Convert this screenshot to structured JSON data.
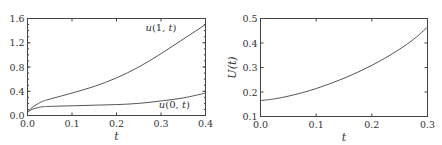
{
  "chart_data": [
    {
      "type": "line",
      "title": "",
      "xlabel": "t",
      "ylabel": "",
      "xlim": [
        0.0,
        0.4
      ],
      "ylim": [
        0.0,
        1.6
      ],
      "xticks": [
        "0.0",
        "0.1",
        "0.2",
        "0.3",
        "0.4"
      ],
      "yticks": [
        "0.0",
        "0.4",
        "0.8",
        "1.2",
        "1.6"
      ],
      "grid": false,
      "legend": "inline annotations",
      "series": [
        {
          "name": "u(1, t)",
          "x": [
            0.0,
            0.01,
            0.03,
            0.05,
            0.1,
            0.15,
            0.2,
            0.25,
            0.3,
            0.35,
            0.4
          ],
          "values": [
            0.05,
            0.13,
            0.22,
            0.27,
            0.37,
            0.48,
            0.62,
            0.8,
            1.02,
            1.26,
            1.5
          ]
        },
        {
          "name": "u(0, t)",
          "x": [
            0.0,
            0.01,
            0.03,
            0.05,
            0.1,
            0.15,
            0.2,
            0.25,
            0.3,
            0.35,
            0.4
          ],
          "values": [
            0.05,
            0.1,
            0.14,
            0.15,
            0.16,
            0.17,
            0.18,
            0.2,
            0.24,
            0.29,
            0.37
          ]
        }
      ],
      "annotations": [
        {
          "text": "u(1, t)",
          "x": 0.3,
          "y": 1.4
        },
        {
          "text": "u(0, t)",
          "x": 0.33,
          "y": 0.12
        }
      ]
    },
    {
      "type": "line",
      "title": "",
      "xlabel": "t",
      "ylabel": "U(t)",
      "xlim": [
        0.0,
        0.3
      ],
      "ylim": [
        0.1,
        0.5
      ],
      "xticks": [
        "0.0",
        "0.1",
        "0.2",
        "0.3"
      ],
      "yticks": [
        "0.1",
        "0.2",
        "0.3",
        "0.4",
        "0.5"
      ],
      "grid": false,
      "series": [
        {
          "name": "U(t)",
          "x": [
            0.0,
            0.025,
            0.05,
            0.075,
            0.1,
            0.125,
            0.15,
            0.175,
            0.2,
            0.225,
            0.25,
            0.275,
            0.3
          ],
          "values": [
            0.165,
            0.172,
            0.183,
            0.197,
            0.214,
            0.234,
            0.256,
            0.281,
            0.309,
            0.34,
            0.375,
            0.415,
            0.465
          ]
        }
      ]
    }
  ]
}
